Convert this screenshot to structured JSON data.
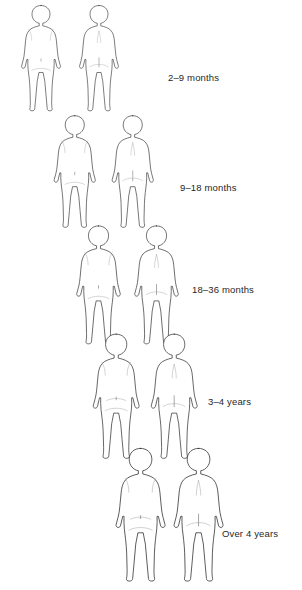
{
  "figure": {
    "view_labels": {
      "front": "front view",
      "back": "back view"
    },
    "stipple_color": "#6e6e6e",
    "outline_color": "#2b2b2b",
    "background_color": "#ffffff"
  },
  "rows": [
    {
      "id": "row-2-9-months",
      "label": "2–9 months",
      "label_x": 168,
      "label_y": 72,
      "row_top": 2,
      "front_x": 12,
      "back_x": 70,
      "figure_scale": 1.0,
      "views": [
        "front",
        "back"
      ],
      "affected_regions_front": [
        "cheeks",
        "chest",
        "abdomen",
        "upper arms",
        "thighs"
      ],
      "affected_regions_back": [
        "scalp",
        "back of head",
        "upper back",
        "lower back",
        "buttocks",
        "arms",
        "legs"
      ],
      "pattern": "widespread truncal and facial involvement"
    },
    {
      "id": "row-9-18-months",
      "label": "9–18 months",
      "label_x": 180,
      "label_y": 182,
      "row_top": 112,
      "front_x": 44,
      "back_x": 102,
      "figure_scale": 1.06,
      "views": [
        "front",
        "back"
      ],
      "affected_regions_front": [
        "cheeks",
        "lower abdomen",
        "nappy area",
        "upper thighs"
      ],
      "affected_regions_back": [
        "upper back",
        "mid back",
        "lower back"
      ],
      "pattern": "trunk and nappy area involvement"
    },
    {
      "id": "row-18-36-months",
      "label": "18–36 months",
      "label_x": 192,
      "label_y": 284,
      "row_top": 222,
      "front_x": 66,
      "back_x": 124,
      "figure_scale": 1.12,
      "views": [
        "front",
        "back"
      ],
      "affected_regions_front": [
        "lower abdomen",
        "groin",
        "knees",
        "shins"
      ],
      "affected_regions_back": [
        "upper back",
        "lower back",
        "buttocks",
        "backs of knees"
      ],
      "pattern": "emerging flexural involvement"
    },
    {
      "id": "row-3-4-years",
      "label": "3–4 years",
      "label_x": 208,
      "label_y": 396,
      "row_top": 330,
      "front_x": 82,
      "back_x": 140,
      "figure_scale": 1.18,
      "views": [
        "front",
        "back"
      ],
      "affected_regions_front": [
        "antecubital fossae",
        "wrists",
        "front of thighs",
        "knees"
      ],
      "affected_regions_back": [
        "nape of neck",
        "popliteal fossae",
        "calves"
      ],
      "pattern": "flexural eczema of elbows and knees"
    },
    {
      "id": "row-over-4-years",
      "label": "Over 4 years",
      "label_x": 222,
      "label_y": 528,
      "row_top": 444,
      "front_x": 104,
      "back_x": 162,
      "figure_scale": 1.26,
      "views": [
        "front",
        "back"
      ],
      "affected_regions_front": [
        "antecubital fossae",
        "wrists",
        "waist",
        "knees"
      ],
      "affected_regions_back": [
        "nape of neck",
        "popliteal fossae"
      ],
      "pattern": "localised flexural eczema"
    }
  ]
}
